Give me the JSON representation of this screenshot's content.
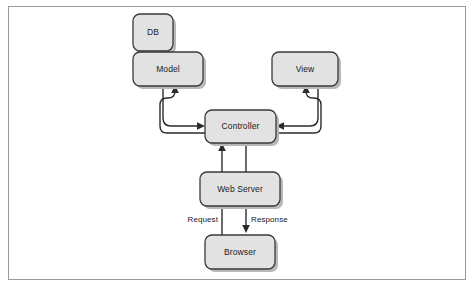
{
  "figure": {
    "type": "flow-diagram",
    "frame": {
      "border_color": "#9a9a9a",
      "background": "#ffffff"
    },
    "style": {
      "node_fill": "#e2e2e2",
      "node_stroke": "#3a3a3a",
      "node_shadow": "#b8b8b8",
      "connector_color": "#2b2b2b",
      "text_color": "#1a1a1a"
    }
  },
  "nodes": [
    {
      "id": "db",
      "label": "DB",
      "x": 133,
      "y": 14,
      "w": 40,
      "h": 37
    },
    {
      "id": "model",
      "label": "Model",
      "x": 133,
      "y": 52,
      "w": 70,
      "h": 34
    },
    {
      "id": "view",
      "label": "View",
      "x": 272,
      "y": 52,
      "w": 66,
      "h": 34
    },
    {
      "id": "controller",
      "label": "Controller",
      "x": 205,
      "y": 110,
      "w": 71,
      "h": 33
    },
    {
      "id": "webserver",
      "label": "Web Server",
      "x": 200,
      "y": 172,
      "w": 80,
      "h": 34
    },
    {
      "id": "browser",
      "label": "Browser",
      "x": 205,
      "y": 235,
      "w": 70,
      "h": 34
    }
  ],
  "edges": [
    {
      "id": "controller-to-model",
      "from": "controller",
      "to": "model",
      "label": ""
    },
    {
      "id": "model-to-controller",
      "from": "model",
      "to": "controller",
      "label": ""
    },
    {
      "id": "controller-to-view",
      "from": "controller",
      "to": "view",
      "label": ""
    },
    {
      "id": "view-to-controller",
      "from": "view",
      "to": "controller",
      "label": ""
    },
    {
      "id": "browser-to-controller-request",
      "from": "browser",
      "to": "controller",
      "label": "Request"
    },
    {
      "id": "controller-to-browser-response",
      "from": "controller",
      "to": "browser",
      "label": "Response"
    }
  ],
  "edge_labels": {
    "request": "Request",
    "response": "Response"
  }
}
